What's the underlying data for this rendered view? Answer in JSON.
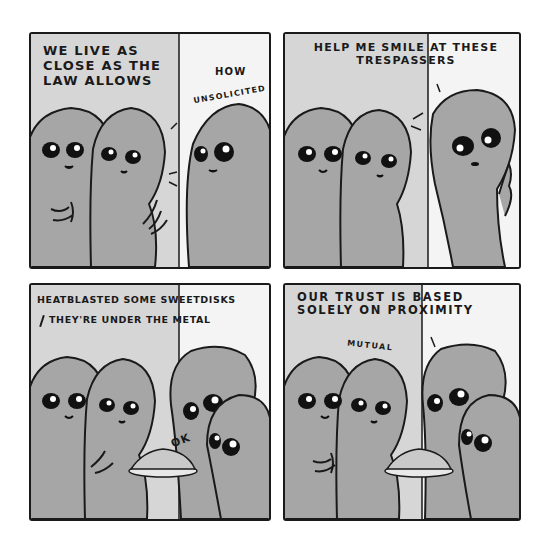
{
  "comic": {
    "panels": [
      {
        "id": 1,
        "captions": {
          "left": "We live as\nclose as the\nlaw allows",
          "right_top": "How",
          "right_arc": "Unsolicited"
        }
      },
      {
        "id": 2,
        "captions": {
          "main": "Help me smile at these\ntrespassers"
        }
      },
      {
        "id": 3,
        "captions": {
          "line1": "Heatblasted some sweetdisks",
          "line2": "They're under the metal",
          "reply": "OK"
        }
      },
      {
        "id": 4,
        "captions": {
          "main": "Our trust is based\nsolely on proximity",
          "arc": "Mutual"
        }
      }
    ]
  },
  "colors": {
    "background": "#ffffff",
    "line": "#1a1a1a",
    "wall_left": "#d6d6d6",
    "wall_right": "#f4f4f4",
    "alien": "#a6a6a6"
  }
}
